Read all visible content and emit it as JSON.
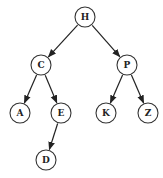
{
  "diagram": {
    "type": "binary-search-tree",
    "node_radius": 10,
    "colors": {
      "stroke": "#333333",
      "edge": "#222222",
      "fill": "#ffffff",
      "text": "#222222"
    },
    "nodes": [
      {
        "id": "H",
        "label": "H",
        "x": 85,
        "y": 17
      },
      {
        "id": "C",
        "label": "C",
        "x": 41,
        "y": 65
      },
      {
        "id": "P",
        "label": "P",
        "x": 127,
        "y": 65
      },
      {
        "id": "A",
        "label": "A",
        "x": 20,
        "y": 113
      },
      {
        "id": "E",
        "label": "E",
        "x": 61,
        "y": 113
      },
      {
        "id": "K",
        "label": "K",
        "x": 106,
        "y": 113
      },
      {
        "id": "Z",
        "label": "Z",
        "x": 148,
        "y": 113
      },
      {
        "id": "D",
        "label": "D",
        "x": 46,
        "y": 160
      }
    ],
    "edges": [
      {
        "from": "H",
        "to": "C"
      },
      {
        "from": "H",
        "to": "P"
      },
      {
        "from": "C",
        "to": "A"
      },
      {
        "from": "C",
        "to": "E"
      },
      {
        "from": "P",
        "to": "K"
      },
      {
        "from": "P",
        "to": "Z"
      },
      {
        "from": "E",
        "to": "D"
      }
    ]
  }
}
